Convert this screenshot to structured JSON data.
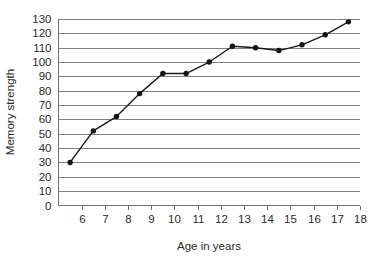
{
  "chart_data": {
    "type": "line",
    "title": "",
    "xlabel": "Age in years",
    "ylabel": "Memory strength",
    "x": [
      5.5,
      6.5,
      7.5,
      8.5,
      9.5,
      10.5,
      11.5,
      12.5,
      13.5,
      14.5,
      15.5,
      16.5,
      17.5
    ],
    "values": [
      30,
      52,
      62,
      78,
      92,
      92,
      100,
      111,
      110,
      108,
      112,
      119,
      128
    ],
    "series": [
      {
        "name": "Memory strength",
        "values": [
          30,
          52,
          62,
          78,
          92,
          92,
          100,
          111,
          110,
          108,
          112,
          119,
          128
        ]
      }
    ],
    "xlim": [
      5,
      18
    ],
    "ylim": [
      0,
      130
    ],
    "x_ticks": [
      6,
      7,
      8,
      9,
      10,
      11,
      12,
      13,
      14,
      15,
      16,
      17,
      18
    ],
    "x_tick_labels": [
      "6",
      "7",
      "8",
      "9",
      "10",
      "11",
      "12",
      "13",
      "14",
      "15",
      "16",
      "17",
      "18"
    ],
    "y_ticks": [
      0,
      10,
      20,
      30,
      40,
      50,
      60,
      70,
      80,
      90,
      100,
      110,
      120,
      130
    ],
    "y_tick_labels": [
      "0",
      "10",
      "20",
      "30",
      "40",
      "50",
      "60",
      "70",
      "80",
      "90",
      "100",
      "110",
      "120",
      "130"
    ],
    "grid": "horizontal",
    "legend": "none",
    "marker": "filled-circle",
    "line_color": "#141414",
    "grid_color": "#808080",
    "background_color": "#ffffff"
  },
  "axes": {
    "x_title": "Age in years",
    "y_title": "Memory strength"
  }
}
